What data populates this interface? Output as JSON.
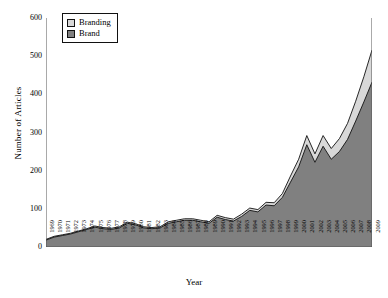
{
  "chart_data": {
    "type": "area",
    "stacked": true,
    "title": "",
    "xlabel": "Year",
    "ylabel": "Number of Articles",
    "ylim": [
      0,
      600
    ],
    "ytick_values": [
      0,
      100,
      200,
      300,
      400,
      500,
      600
    ],
    "grid": false,
    "legend_position": "top-left-inside",
    "categories": [
      "1969",
      "1970",
      "1971",
      "1972",
      "1973",
      "1974",
      "1975",
      "1976",
      "1977",
      "1978",
      "1979",
      "1980",
      "1981",
      "1982",
      "1983",
      "1984",
      "1985",
      "1986",
      "1987",
      "1988",
      "1989",
      "1990",
      "1991",
      "1992",
      "1993",
      "1994",
      "1995",
      "1996",
      "1997",
      "1998",
      "1999",
      "2000",
      "2001",
      "2002",
      "2003",
      "2004",
      "2005",
      "2006",
      "2007",
      "2008",
      "2009"
    ],
    "series": [
      {
        "name": "Brand",
        "color": "#808080",
        "values": [
          18,
          26,
          30,
          34,
          40,
          46,
          52,
          48,
          46,
          50,
          62,
          58,
          50,
          48,
          50,
          62,
          66,
          70,
          70,
          66,
          62,
          78,
          72,
          68,
          80,
          96,
          92,
          110,
          108,
          130,
          170,
          210,
          268,
          222,
          264,
          230,
          250,
          282,
          330,
          380,
          432
        ]
      },
      {
        "name": "Branding",
        "color": "#d8d8d8",
        "values": [
          2,
          2,
          2,
          2,
          2,
          2,
          3,
          3,
          3,
          3,
          3,
          3,
          3,
          3,
          3,
          4,
          4,
          4,
          4,
          4,
          4,
          5,
          5,
          5,
          6,
          6,
          6,
          7,
          8,
          10,
          16,
          20,
          24,
          22,
          28,
          28,
          34,
          42,
          52,
          66,
          84
        ]
      }
    ],
    "totals": [
      20,
      28,
      32,
      36,
      42,
      48,
      55,
      51,
      49,
      53,
      65,
      61,
      53,
      51,
      53,
      66,
      70,
      74,
      74,
      70,
      66,
      83,
      77,
      73,
      86,
      102,
      98,
      117,
      116,
      140,
      186,
      230,
      292,
      244,
      292,
      258,
      284,
      324,
      382,
      446,
      516
    ]
  },
  "legend": {
    "entries": [
      {
        "label": "Branding",
        "color": "#d8d8d8"
      },
      {
        "label": "Brand",
        "color": "#808080"
      }
    ]
  },
  "axes": {
    "y_title": "Number of Articles",
    "x_title": "Year"
  }
}
